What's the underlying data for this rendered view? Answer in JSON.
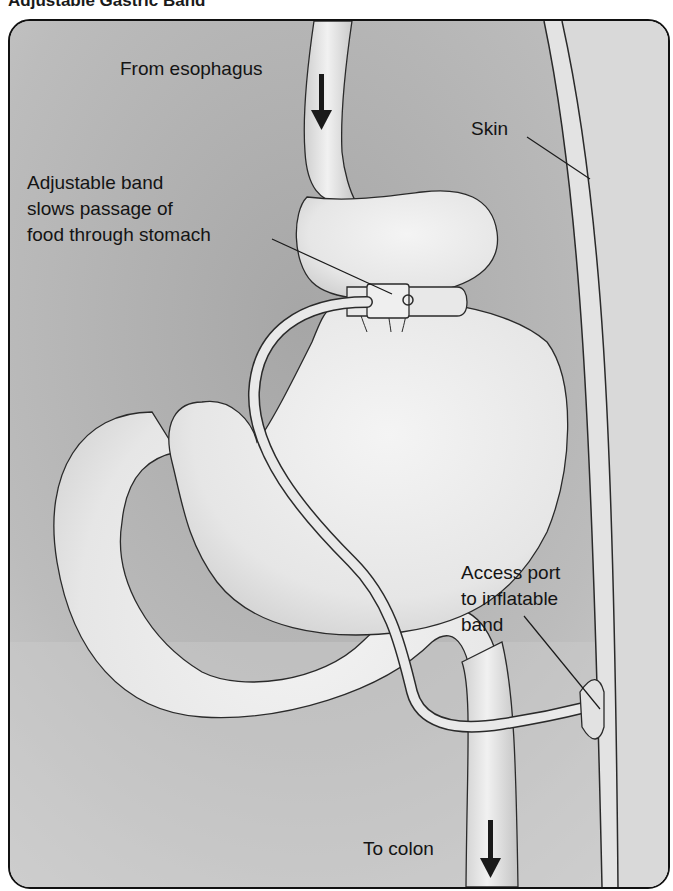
{
  "figure": {
    "title": "Adjustable Gastric Band",
    "labels": {
      "esophagus": "From esophagus",
      "skin": "Skin",
      "band_line1": "Adjustable band",
      "band_line2": "slows passage of",
      "band_line3": "food through stomach",
      "port_line1": "Access port",
      "port_line2": "to inflatable",
      "port_line3": "band",
      "colon": "To colon"
    },
    "icons": {
      "esophagus_arrow": "arrow-down",
      "colon_arrow": "arrow-down"
    },
    "colors": {
      "background_dark": "#a9a9a9",
      "background_light": "#d6d6d6",
      "organ_fill": "#ececec",
      "outline": "#2a2a2a",
      "skin_fill": "#e2e2e2"
    }
  }
}
